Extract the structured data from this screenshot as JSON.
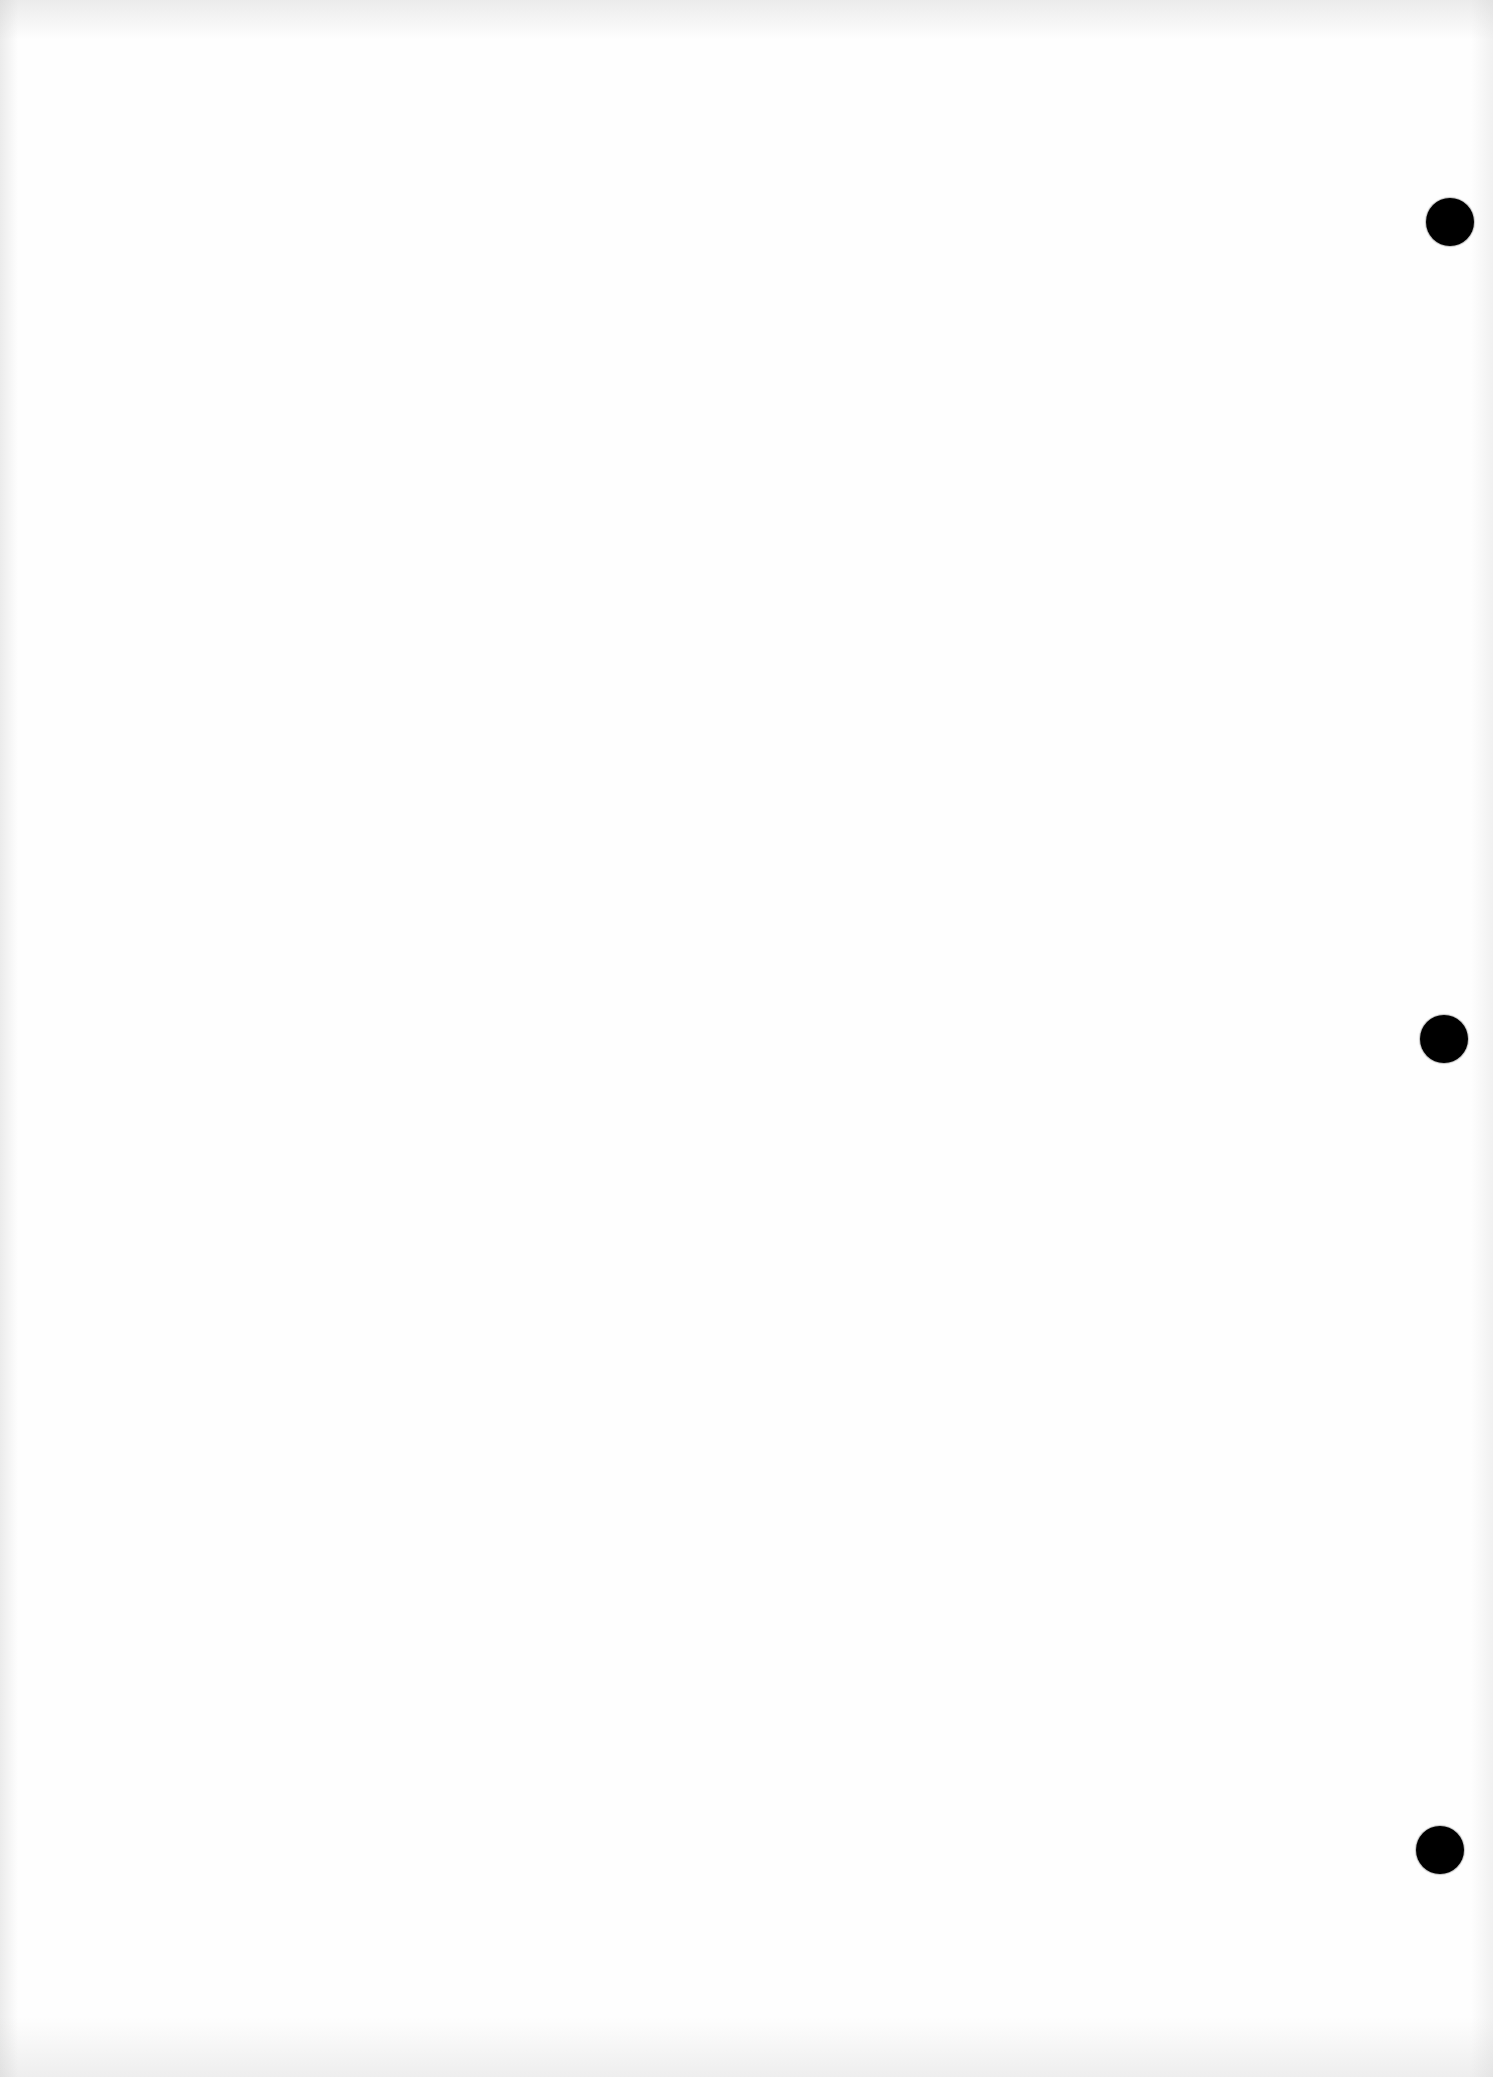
{
  "document": {
    "type": "blank scanned page",
    "background_color": "#fefefe",
    "text": ""
  },
  "punch_holes": [
    {
      "name": "punch-hole-top",
      "cx": 1450,
      "cy": 222,
      "diameter": 48,
      "color": "#000000"
    },
    {
      "name": "punch-hole-middle",
      "cx": 1444,
      "cy": 1039,
      "diameter": 48,
      "color": "#000000"
    },
    {
      "name": "punch-hole-bottom",
      "cx": 1440,
      "cy": 1850,
      "diameter": 48,
      "color": "#000000"
    }
  ]
}
